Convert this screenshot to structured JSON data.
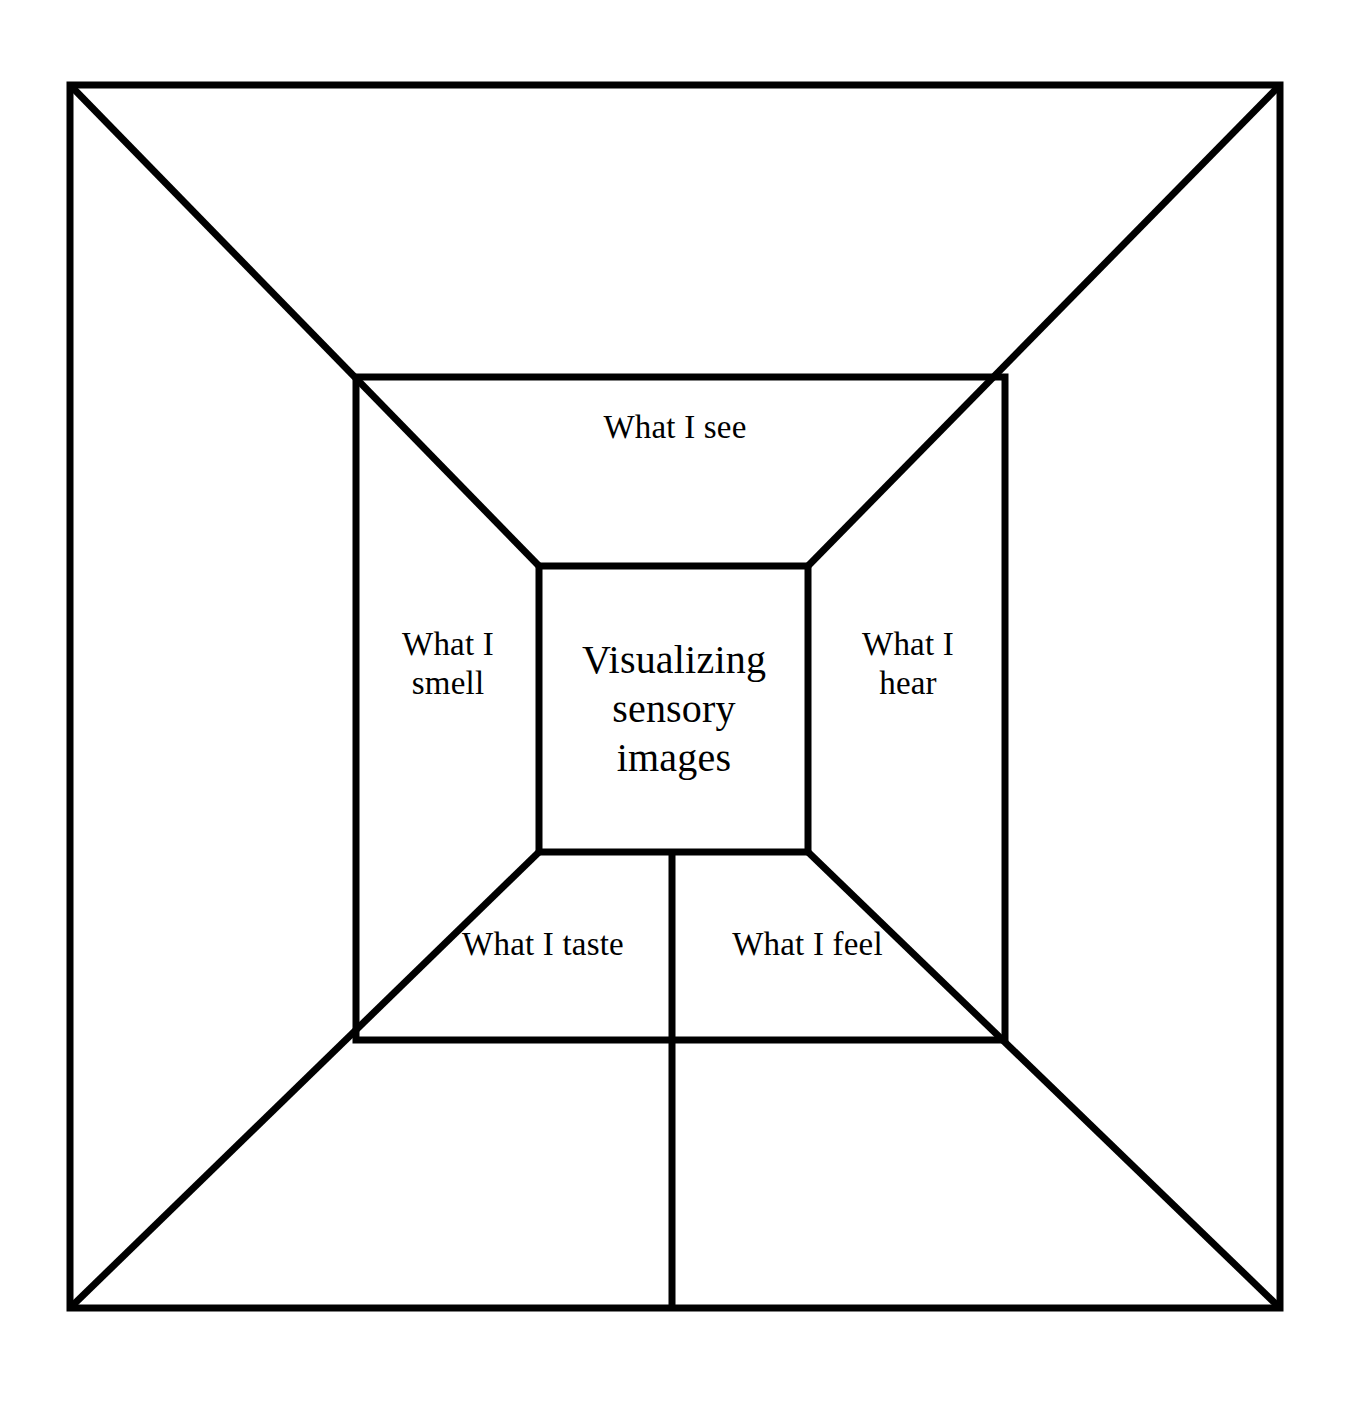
{
  "diagram": {
    "type": "nested-square-sensory-map",
    "title": "Visualizing sensory images",
    "background_color": "#ffffff",
    "line_color": "#000000",
    "center": {
      "label": "Visualizing\nsensory\nimages",
      "box": {
        "x": 539,
        "y": 566,
        "width": 269,
        "height": 286
      }
    },
    "sections": [
      {
        "id": "see",
        "label": "What I see",
        "position": "top"
      },
      {
        "id": "hear",
        "label": "What I\nhear",
        "position": "right"
      },
      {
        "id": "feel",
        "label": "What I feel",
        "position": "bottom-right"
      },
      {
        "id": "taste",
        "label": "What I taste",
        "position": "bottom-left"
      },
      {
        "id": "smell",
        "label": "What I\nsmell",
        "position": "left"
      }
    ],
    "boxes": {
      "outer": {
        "x": 70,
        "y": 85,
        "width": 1210,
        "height": 1223
      },
      "middle": {
        "x": 356,
        "y": 377,
        "width": 649,
        "height": 663
      },
      "inner": {
        "x": 539,
        "y": 566,
        "width": 269,
        "height": 286
      }
    },
    "connectors": {
      "diagonals": [
        {
          "from": "outer-top-left",
          "to": "inner-top-left"
        },
        {
          "from": "outer-top-right",
          "to": "inner-top-right"
        },
        {
          "from": "outer-bottom-left",
          "to": "inner-bottom-left"
        },
        {
          "from": "outer-bottom-right",
          "to": "inner-bottom-right"
        }
      ],
      "vertical_divider": {
        "x": 672,
        "y_start": 852,
        "y_end": 1308
      }
    }
  }
}
